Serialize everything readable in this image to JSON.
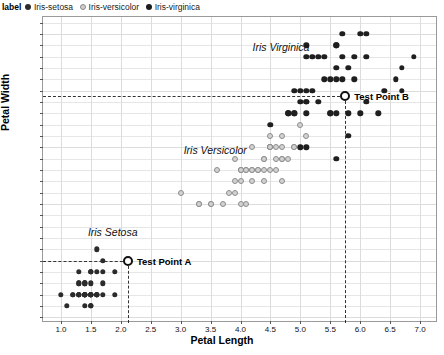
{
  "legend": {
    "title": "label",
    "items": [
      {
        "label": "Iris-setosa",
        "marker": "filled-dot-dark",
        "color": "#2b2b2b"
      },
      {
        "label": "Iris-versicolor",
        "marker": "open-dot-gray",
        "color": "#d2d2d2"
      },
      {
        "label": "Iris-virginica",
        "marker": "filled-dot-black",
        "color": "#1f1f1f"
      }
    ]
  },
  "annotations": [
    {
      "text": "Iris Setosa",
      "x": 1.45,
      "y": 0.74
    },
    {
      "text": "Iris Versicolor",
      "x": 3.05,
      "y": 1.47
    },
    {
      "text": "Iris Virginica",
      "x": 4.2,
      "y": 2.38
    }
  ],
  "test_points": [
    {
      "name": "Test Point A",
      "label": "Test Point A",
      "x": 2.12,
      "y": 0.5
    },
    {
      "name": "Test Point B",
      "label": "Test Point B",
      "x": 5.75,
      "y": 1.95
    }
  ],
  "chart_data": {
    "type": "scatter",
    "title": "",
    "xlabel": "Petal Length",
    "ylabel": "Petal Width",
    "xlim": [
      0.7,
      7.3
    ],
    "ylim": [
      -0.05,
      2.65
    ],
    "xticks": [
      1.0,
      1.5,
      2.0,
      2.5,
      3.0,
      3.5,
      4.0,
      4.5,
      5.0,
      5.5,
      6.0,
      6.5,
      7.0
    ],
    "yticks": [
      0.0,
      0.1,
      0.2,
      0.3,
      0.4,
      0.5,
      0.6,
      0.7,
      0.8,
      0.9,
      1.0,
      1.1,
      1.2,
      1.3,
      1.4,
      1.5,
      1.6,
      1.7,
      1.8,
      1.9,
      2.0,
      2.1,
      2.2,
      2.3,
      2.4,
      2.5,
      2.6
    ],
    "grid": true,
    "legend_position": "top-left-outside",
    "series": [
      {
        "name": "Iris-setosa",
        "color": "#2b2b2b",
        "points": [
          [
            1.4,
            0.2
          ],
          [
            1.4,
            0.2
          ],
          [
            1.3,
            0.2
          ],
          [
            1.5,
            0.2
          ],
          [
            1.4,
            0.2
          ],
          [
            1.7,
            0.4
          ],
          [
            1.4,
            0.3
          ],
          [
            1.5,
            0.2
          ],
          [
            1.4,
            0.2
          ],
          [
            1.5,
            0.1
          ],
          [
            1.5,
            0.2
          ],
          [
            1.6,
            0.2
          ],
          [
            1.4,
            0.1
          ],
          [
            1.1,
            0.1
          ],
          [
            1.2,
            0.2
          ],
          [
            1.5,
            0.4
          ],
          [
            1.3,
            0.4
          ],
          [
            1.4,
            0.3
          ],
          [
            1.7,
            0.3
          ],
          [
            1.5,
            0.3
          ],
          [
            1.7,
            0.2
          ],
          [
            1.5,
            0.4
          ],
          [
            1.0,
            0.2
          ],
          [
            1.7,
            0.5
          ],
          [
            1.9,
            0.2
          ],
          [
            1.6,
            0.2
          ],
          [
            1.6,
            0.4
          ],
          [
            1.5,
            0.2
          ],
          [
            1.4,
            0.2
          ],
          [
            1.6,
            0.2
          ],
          [
            1.6,
            0.2
          ],
          [
            1.5,
            0.4
          ],
          [
            1.5,
            0.1
          ],
          [
            1.4,
            0.2
          ],
          [
            1.5,
            0.2
          ],
          [
            1.2,
            0.2
          ],
          [
            1.3,
            0.2
          ],
          [
            1.5,
            0.1
          ],
          [
            1.3,
            0.2
          ],
          [
            1.5,
            0.2
          ],
          [
            1.3,
            0.3
          ],
          [
            1.3,
            0.3
          ],
          [
            1.3,
            0.2
          ],
          [
            1.6,
            0.6
          ],
          [
            1.9,
            0.4
          ],
          [
            1.4,
            0.3
          ],
          [
            1.6,
            0.2
          ],
          [
            1.4,
            0.2
          ],
          [
            1.5,
            0.2
          ],
          [
            1.4,
            0.2
          ]
        ]
      },
      {
        "name": "Iris-versicolor",
        "color": "#d2d2d2",
        "points": [
          [
            4.7,
            1.4
          ],
          [
            4.5,
            1.5
          ],
          [
            4.9,
            1.5
          ],
          [
            4.0,
            1.3
          ],
          [
            4.6,
            1.5
          ],
          [
            4.5,
            1.3
          ],
          [
            4.7,
            1.6
          ],
          [
            3.3,
            1.0
          ],
          [
            4.6,
            1.3
          ],
          [
            3.9,
            1.4
          ],
          [
            3.5,
            1.0
          ],
          [
            4.2,
            1.5
          ],
          [
            4.0,
            1.0
          ],
          [
            4.7,
            1.4
          ],
          [
            3.6,
            1.3
          ],
          [
            4.4,
            1.4
          ],
          [
            4.5,
            1.5
          ],
          [
            4.1,
            1.0
          ],
          [
            4.5,
            1.5
          ],
          [
            3.9,
            1.1
          ],
          [
            4.8,
            1.8
          ],
          [
            4.0,
            1.3
          ],
          [
            4.9,
            1.5
          ],
          [
            4.7,
            1.2
          ],
          [
            4.3,
            1.3
          ],
          [
            4.4,
            1.4
          ],
          [
            4.8,
            1.4
          ],
          [
            5.0,
            1.7
          ],
          [
            4.5,
            1.5
          ],
          [
            3.5,
            1.0
          ],
          [
            3.8,
            1.1
          ],
          [
            3.7,
            1.0
          ],
          [
            3.9,
            1.2
          ],
          [
            5.1,
            1.6
          ],
          [
            4.5,
            1.5
          ],
          [
            4.5,
            1.6
          ],
          [
            4.7,
            1.5
          ],
          [
            4.4,
            1.3
          ],
          [
            4.1,
            1.3
          ],
          [
            4.0,
            1.3
          ],
          [
            4.4,
            1.2
          ],
          [
            4.6,
            1.4
          ],
          [
            4.0,
            1.2
          ],
          [
            3.3,
            1.0
          ],
          [
            4.2,
            1.3
          ],
          [
            4.2,
            1.2
          ],
          [
            4.2,
            1.3
          ],
          [
            4.3,
            1.3
          ],
          [
            3.0,
            1.1
          ],
          [
            4.1,
            1.3
          ]
        ]
      },
      {
        "name": "Iris-virginica",
        "color": "#1f1f1f",
        "points": [
          [
            6.0,
            2.5
          ],
          [
            5.1,
            1.9
          ],
          [
            5.9,
            2.1
          ],
          [
            5.6,
            1.8
          ],
          [
            5.8,
            2.2
          ],
          [
            6.6,
            2.1
          ],
          [
            4.5,
            1.7
          ],
          [
            6.3,
            1.8
          ],
          [
            5.8,
            1.8
          ],
          [
            6.1,
            2.5
          ],
          [
            5.1,
            2.0
          ],
          [
            5.3,
            1.9
          ],
          [
            5.5,
            2.1
          ],
          [
            5.0,
            2.0
          ],
          [
            5.1,
            2.4
          ],
          [
            5.3,
            2.3
          ],
          [
            5.5,
            1.8
          ],
          [
            6.7,
            2.2
          ],
          [
            6.9,
            2.3
          ],
          [
            5.0,
            1.5
          ],
          [
            5.7,
            2.3
          ],
          [
            4.9,
            2.0
          ],
          [
            6.7,
            2.0
          ],
          [
            4.9,
            1.8
          ],
          [
            5.7,
            2.1
          ],
          [
            6.0,
            1.8
          ],
          [
            4.8,
            1.8
          ],
          [
            4.9,
            1.8
          ],
          [
            5.6,
            2.1
          ],
          [
            5.8,
            1.6
          ],
          [
            6.1,
            1.9
          ],
          [
            6.4,
            2.0
          ],
          [
            5.6,
            2.2
          ],
          [
            5.1,
            1.5
          ],
          [
            5.6,
            1.4
          ],
          [
            6.1,
            2.3
          ],
          [
            5.6,
            2.4
          ],
          [
            5.5,
            1.8
          ],
          [
            4.8,
            1.8
          ],
          [
            5.4,
            2.1
          ],
          [
            5.6,
            2.4
          ],
          [
            5.1,
            2.3
          ],
          [
            5.1,
            1.9
          ],
          [
            5.9,
            2.3
          ],
          [
            5.7,
            2.5
          ],
          [
            5.2,
            2.3
          ],
          [
            5.0,
            1.9
          ],
          [
            5.2,
            2.0
          ],
          [
            5.4,
            2.3
          ],
          [
            5.1,
            1.8
          ]
        ]
      }
    ]
  }
}
